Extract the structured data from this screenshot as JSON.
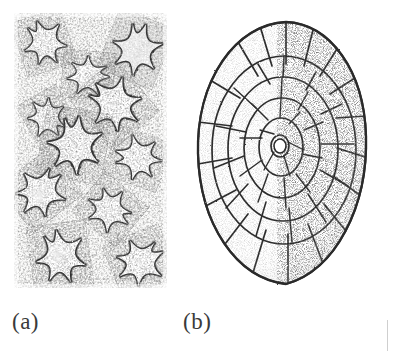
{
  "figure": {
    "background_color": "#ffffff",
    "ink_color": "#2b2b2b",
    "style": "stippled line engraving, black and white",
    "panels": [
      {
        "id": "a",
        "label": "(a)",
        "subject": "starfish-slab",
        "description": "Bedding-plane slab crowded with overlapping five-rayed starfish preserved in relief",
        "frame": {
          "x": 14,
          "y": 13,
          "width": 153,
          "height": 275
        },
        "shading": "dense stipple with dark ray outlines on a mottled matrix",
        "element_count": 11
      },
      {
        "id": "b",
        "label": "(b)",
        "subject": "plated-echinoderm-test",
        "description": "Ovoid fossil echinoderm test viewed from above, built of polygonal plates radiating from a small central plate",
        "frame": {
          "x": 190,
          "y": 18,
          "width": 188,
          "height": 275
        },
        "shading": "stippled plate margins, elongate plates around the periphery",
        "plate_rings": 5
      }
    ],
    "page_edge_rule": {
      "visible": true,
      "color": "#cfcfcf"
    }
  },
  "labels": {
    "panel_a": "(a)",
    "panel_b": "(b)"
  }
}
